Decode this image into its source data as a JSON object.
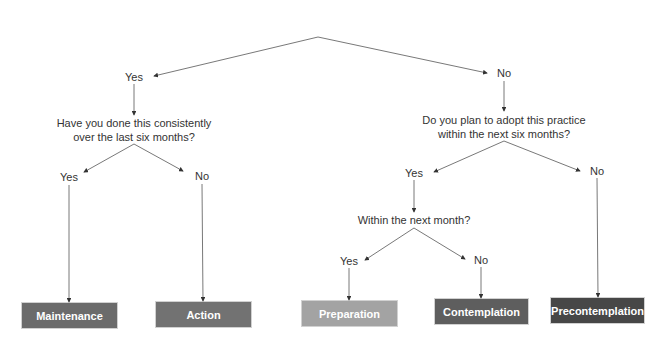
{
  "diagram": {
    "branch_top": {
      "yes_label": "Yes",
      "no_label": "No"
    },
    "question_left": {
      "line1": "Have you done this consistently",
      "line2": "over the last six months?"
    },
    "question_left_branches": {
      "yes_label": "Yes",
      "no_label": "No"
    },
    "question_right": {
      "line1": "Do you plan to adopt this practice",
      "line2": "within the next six months?"
    },
    "question_right_branches": {
      "yes_label": "Yes",
      "no_label": "No"
    },
    "question_sub": {
      "text": "Within the next month?"
    },
    "question_sub_branches": {
      "yes_label": "Yes",
      "no_label": "No"
    },
    "outcomes": [
      {
        "label": "Maintenance",
        "color": "#6b6b6b"
      },
      {
        "label": "Action",
        "color": "#727272"
      },
      {
        "label": "Preparation",
        "color": "#a3a3a3"
      },
      {
        "label": "Contemplation",
        "color": "#5e5e5e"
      },
      {
        "label": "Precontemplation",
        "color": "#474747"
      }
    ],
    "line_color": "#444444"
  }
}
